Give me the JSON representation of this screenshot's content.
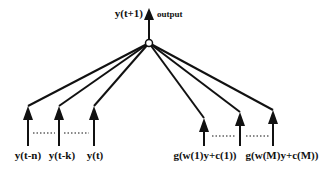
{
  "output": {
    "label": "y(t+1)",
    "caption": "output"
  },
  "inputs_left": [
    {
      "label": "y(t-n)",
      "x": 28
    },
    {
      "label": "y(t-k)",
      "x": 59
    },
    {
      "label": "y(t)",
      "x": 94
    }
  ],
  "inputs_right": [
    {
      "label": "g(w(1)y+c(1))",
      "x": 204
    },
    {
      "label": "",
      "x": 240
    },
    {
      "label": "g(w(M)y+c(M))",
      "x": 273
    }
  ],
  "ellipsis": "......",
  "node": {
    "x": 149,
    "y": 43
  }
}
